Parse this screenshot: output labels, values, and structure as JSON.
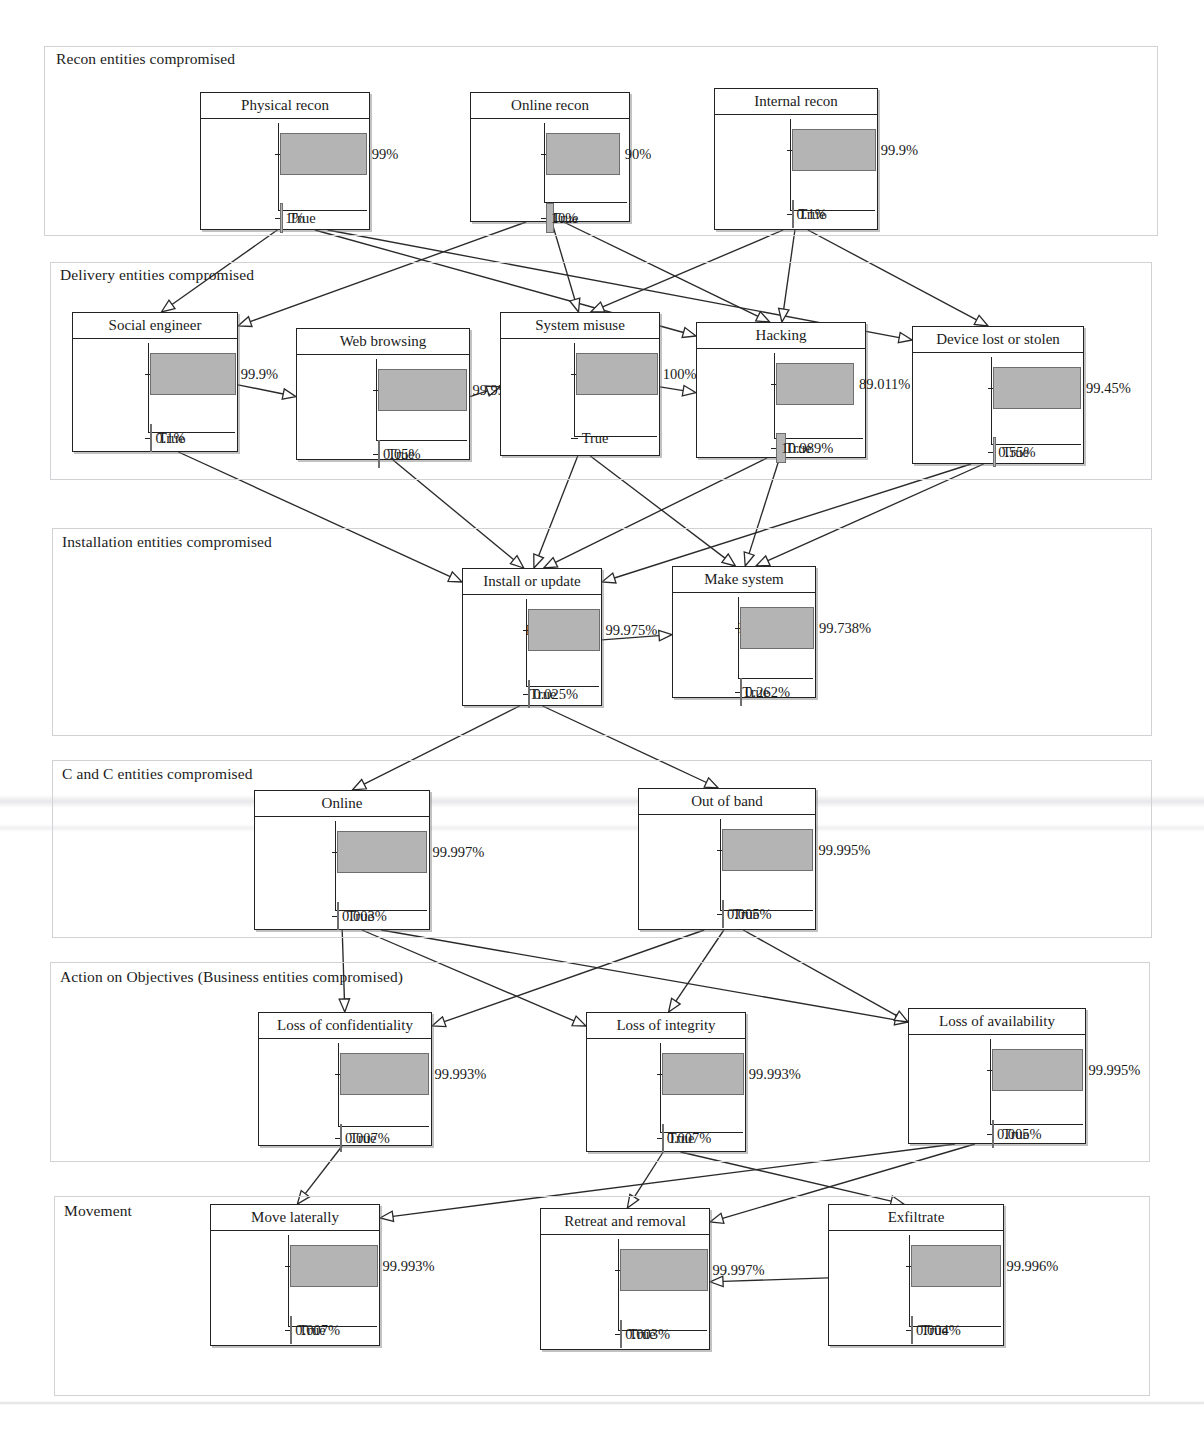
{
  "figure": {
    "type": "bayesian-network-belief-bars",
    "bar_fill_color": "#b4b4b4",
    "bar_stroke_color": "#6f6f6f",
    "node_border_color": "#222222",
    "lane_border_color": "#d2d2d6",
    "edge_color": "#2a2a2a",
    "state_labels": [
      "False",
      "True"
    ]
  },
  "lanes": [
    {
      "id": "recon",
      "title": "Recon entities compromised"
    },
    {
      "id": "delivery",
      "title": "Delivery entities compromised"
    },
    {
      "id": "installation",
      "title": "Installation entities compromised"
    },
    {
      "id": "candc",
      "title": "C and C entities compromised"
    },
    {
      "id": "objectives",
      "title": "Action on Objectives (Business entities compromised)"
    },
    {
      "id": "movement",
      "title": "Movement"
    }
  ],
  "nodes": [
    {
      "id": "physical-recon",
      "lane": "recon",
      "title": "Physical recon",
      "false_label": "99%",
      "true_label": "1%",
      "false_pct": 99,
      "true_pct": 1
    },
    {
      "id": "online-recon",
      "lane": "recon",
      "title": "Online recon",
      "false_label": "90%",
      "true_label": "10%",
      "false_pct": 90,
      "true_pct": 10
    },
    {
      "id": "internal-recon",
      "lane": "recon",
      "title": "Internal recon",
      "false_label": "99.9%",
      "true_label": "0.1%",
      "false_pct": 99.9,
      "true_pct": 0.1
    },
    {
      "id": "social-engineer",
      "lane": "delivery",
      "title": "Social engineer",
      "false_label": "99.9%",
      "true_label": "0.1%",
      "false_pct": 99.9,
      "true_pct": 0.1
    },
    {
      "id": "web-browsing",
      "lane": "delivery",
      "title": "Web browsing",
      "false_label": "99.95%",
      "true_label": "0.05%",
      "false_pct": 99.95,
      "true_pct": 0.05
    },
    {
      "id": "system-misuse",
      "lane": "delivery",
      "title": "System misuse",
      "false_label": "100%",
      "true_label": "",
      "false_pct": 100,
      "true_pct": 0
    },
    {
      "id": "hacking",
      "lane": "delivery",
      "title": "Hacking",
      "false_label": "89.011%",
      "true_label": "10.989%",
      "false_pct": 89.011,
      "true_pct": 10.989
    },
    {
      "id": "device-lost-or-stolen",
      "lane": "delivery",
      "title": "Device lost or stolen",
      "false_label": "99.45%",
      "true_label": "0.55%",
      "false_pct": 99.45,
      "true_pct": 0.55
    },
    {
      "id": "install-or-update",
      "lane": "installation",
      "title": "Install or update",
      "false_label": "99.975%",
      "true_label": "0.025%",
      "false_pct": 99.975,
      "true_pct": 0.025
    },
    {
      "id": "make-system",
      "lane": "installation",
      "title": "Make system",
      "false_label": "99.738%",
      "true_label": "0.262%",
      "false_pct": 99.738,
      "true_pct": 0.262
    },
    {
      "id": "online",
      "lane": "candc",
      "title": "Online",
      "false_label": "99.997%",
      "true_label": "0.003%",
      "false_pct": 99.997,
      "true_pct": 0.003
    },
    {
      "id": "out-of-band",
      "lane": "candc",
      "title": "Out of band",
      "false_label": "99.995%",
      "true_label": "0.005%",
      "false_pct": 99.995,
      "true_pct": 0.005
    },
    {
      "id": "loss-of-confidentiality",
      "lane": "objectives",
      "title": "Loss of confidentiality",
      "false_label": "99.993%",
      "true_label": "0.007%",
      "false_pct": 99.993,
      "true_pct": 0.007
    },
    {
      "id": "loss-of-integrity",
      "lane": "objectives",
      "title": "Loss of integrity",
      "false_label": "99.993%",
      "true_label": "0.007%",
      "false_pct": 99.993,
      "true_pct": 0.007
    },
    {
      "id": "loss-of-availability",
      "lane": "objectives",
      "title": "Loss of availability",
      "false_label": "99.995%",
      "true_label": "0.005%",
      "false_pct": 99.995,
      "true_pct": 0.005
    },
    {
      "id": "move-laterally",
      "lane": "movement",
      "title": "Move laterally",
      "false_label": "99.993%",
      "true_label": "0.007%",
      "false_pct": 99.993,
      "true_pct": 0.007
    },
    {
      "id": "retreat-and-removal",
      "lane": "movement",
      "title": "Retreat and removal",
      "false_label": "99.997%",
      "true_label": "0.003%",
      "false_pct": 99.997,
      "true_pct": 0.003
    },
    {
      "id": "exfiltrate",
      "lane": "movement",
      "title": "Exfiltrate",
      "false_label": "99.996%",
      "true_label": "0.004%",
      "false_pct": 99.996,
      "true_pct": 0.004
    }
  ],
  "edges": [
    {
      "from": "physical-recon",
      "to": "social-engineer"
    },
    {
      "from": "physical-recon",
      "to": "hacking"
    },
    {
      "from": "physical-recon",
      "to": "device-lost-or-stolen"
    },
    {
      "from": "online-recon",
      "to": "social-engineer"
    },
    {
      "from": "online-recon",
      "to": "system-misuse"
    },
    {
      "from": "online-recon",
      "to": "hacking"
    },
    {
      "from": "internal-recon",
      "to": "system-misuse"
    },
    {
      "from": "internal-recon",
      "to": "hacking"
    },
    {
      "from": "internal-recon",
      "to": "device-lost-or-stolen"
    },
    {
      "from": "social-engineer",
      "to": "web-browsing"
    },
    {
      "from": "web-browsing",
      "to": "system-misuse"
    },
    {
      "from": "system-misuse",
      "to": "hacking"
    },
    {
      "from": "social-engineer",
      "to": "install-or-update"
    },
    {
      "from": "web-browsing",
      "to": "install-or-update"
    },
    {
      "from": "system-misuse",
      "to": "install-or-update"
    },
    {
      "from": "hacking",
      "to": "install-or-update"
    },
    {
      "from": "device-lost-or-stolen",
      "to": "install-or-update"
    },
    {
      "from": "system-misuse",
      "to": "make-system"
    },
    {
      "from": "hacking",
      "to": "make-system"
    },
    {
      "from": "device-lost-or-stolen",
      "to": "make-system"
    },
    {
      "from": "install-or-update",
      "to": "make-system"
    },
    {
      "from": "install-or-update",
      "to": "online"
    },
    {
      "from": "install-or-update",
      "to": "out-of-band"
    },
    {
      "from": "online",
      "to": "loss-of-confidentiality"
    },
    {
      "from": "online",
      "to": "loss-of-integrity"
    },
    {
      "from": "online",
      "to": "loss-of-availability"
    },
    {
      "from": "out-of-band",
      "to": "loss-of-confidentiality"
    },
    {
      "from": "out-of-band",
      "to": "loss-of-integrity"
    },
    {
      "from": "out-of-band",
      "to": "loss-of-availability"
    },
    {
      "from": "loss-of-confidentiality",
      "to": "move-laterally"
    },
    {
      "from": "loss-of-integrity",
      "to": "retreat-and-removal"
    },
    {
      "from": "loss-of-integrity",
      "to": "exfiltrate"
    },
    {
      "from": "loss-of-availability",
      "to": "move-laterally"
    },
    {
      "from": "loss-of-availability",
      "to": "retreat-and-removal"
    },
    {
      "from": "exfiltrate",
      "to": "retreat-and-removal"
    }
  ]
}
